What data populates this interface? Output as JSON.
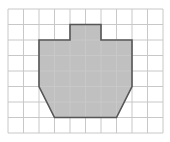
{
  "figure": {
    "type": "grid-shape",
    "grid": {
      "columns": 10,
      "rows": 8,
      "origin_px": [
        8,
        9
      ],
      "cell_px": 15.5,
      "line_color": "#c8c8c8"
    },
    "shape": {
      "fill_color": "#c0c0c0",
      "stroke_color": "#555555",
      "vertices_grid": [
        [
          4,
          1
        ],
        [
          6,
          1
        ],
        [
          6,
          2
        ],
        [
          8,
          2
        ],
        [
          8,
          5
        ],
        [
          7,
          7
        ],
        [
          3,
          7
        ],
        [
          2,
          5
        ],
        [
          2,
          2
        ],
        [
          4,
          2
        ]
      ]
    }
  }
}
